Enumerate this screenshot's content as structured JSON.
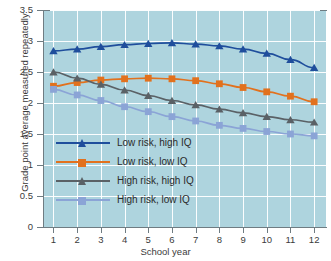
{
  "chart_data": {
    "type": "line",
    "title": "",
    "xlabel": "School year",
    "ylabel": "Grade point average measured repeatedly",
    "x": [
      1,
      2,
      3,
      4,
      5,
      6,
      7,
      8,
      9,
      10,
      11,
      12
    ],
    "xlim": [
      0.6,
      12.5
    ],
    "ylim": [
      0,
      3.5
    ],
    "yticks": [
      "0",
      "0.5",
      "1",
      "1.5",
      "2",
      "2.5",
      "3",
      "3.5"
    ],
    "xticks": [
      "1",
      "2",
      "3",
      "4",
      "5",
      "6",
      "7",
      "8",
      "9",
      "10",
      "11",
      "12"
    ],
    "grid": "both",
    "legend_position": "inside-lower-left",
    "plot_background": "#aed4de",
    "series": [
      {
        "name": "Low risk, high IQ",
        "color": "#1f4e9c",
        "marker": "triangle",
        "values": [
          2.84,
          2.87,
          2.91,
          2.94,
          2.96,
          2.97,
          2.95,
          2.92,
          2.87,
          2.8,
          2.7,
          2.57
        ]
      },
      {
        "name": "Low risk, low IQ",
        "color": "#e2711d",
        "marker": "square",
        "values": [
          2.27,
          2.33,
          2.37,
          2.39,
          2.4,
          2.39,
          2.36,
          2.31,
          2.25,
          2.18,
          2.11,
          2.02
        ]
      },
      {
        "name": "High risk, high IQ",
        "color": "#5a6166",
        "marker": "triangle",
        "values": [
          2.5,
          2.4,
          2.3,
          2.21,
          2.12,
          2.04,
          1.97,
          1.9,
          1.84,
          1.78,
          1.73,
          1.69
        ]
      },
      {
        "name": "High risk, low IQ",
        "color": "#8ba4d6",
        "marker": "square",
        "values": [
          2.22,
          2.13,
          2.04,
          1.94,
          1.86,
          1.78,
          1.71,
          1.64,
          1.59,
          1.54,
          1.5,
          1.47
        ]
      }
    ]
  }
}
